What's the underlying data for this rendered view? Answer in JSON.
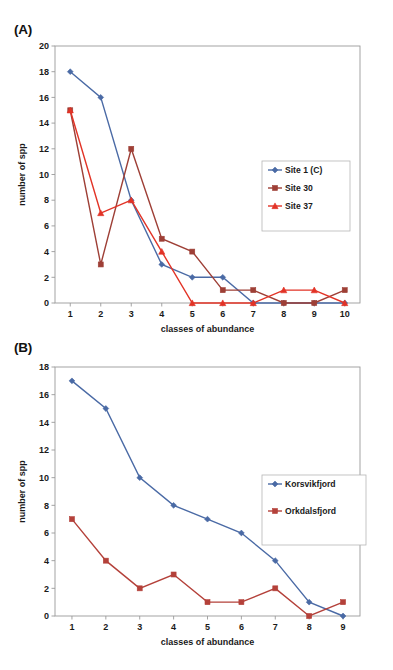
{
  "figure": {
    "panels": [
      {
        "id": "A",
        "label": "(A)",
        "xlabel": "classes of abundance",
        "ylabel": "number of spp"
      },
      {
        "id": "B",
        "label": "(B)",
        "xlabel": "classes of abundance",
        "ylabel": "number of spp"
      }
    ]
  },
  "chart_data": [
    {
      "type": "line",
      "panel": "A",
      "title": "(A)",
      "xlabel": "classes of abundance",
      "ylabel": "number of spp",
      "x": [
        1,
        2,
        3,
        4,
        5,
        6,
        7,
        8,
        9,
        10
      ],
      "xticklabels": [
        "1",
        "2",
        "3",
        "4",
        "5",
        "6",
        "7",
        "8",
        "9",
        "10"
      ],
      "yticklabels": [
        "0",
        "2",
        "4",
        "6",
        "8",
        "10",
        "12",
        "14",
        "16",
        "18",
        "20"
      ],
      "yticks": [
        0,
        2,
        4,
        6,
        8,
        10,
        12,
        14,
        16,
        18,
        20
      ],
      "xlim": [
        0.5,
        10.5
      ],
      "ylim": [
        0,
        20
      ],
      "grid": false,
      "legend_position": "right-middle",
      "series": [
        {
          "name": "Site 1 (C)",
          "values": [
            18,
            16,
            8,
            3,
            2,
            2,
            0,
            0,
            0,
            0
          ],
          "color": "#4a6aa5",
          "marker": "diamond"
        },
        {
          "name": "Site 30",
          "values": [
            15,
            3,
            12,
            5,
            4,
            1,
            1,
            0,
            0,
            1
          ],
          "color": "#9e3f36",
          "marker": "square"
        },
        {
          "name": "Site 37",
          "values": [
            15,
            7,
            8,
            4,
            0,
            0,
            0,
            1,
            1,
            0
          ],
          "color": "#e23326",
          "marker": "triangle"
        }
      ]
    },
    {
      "type": "line",
      "panel": "B",
      "title": "(B)",
      "xlabel": "classes of abundance",
      "ylabel": "number of spp",
      "x": [
        1,
        2,
        3,
        4,
        5,
        6,
        7,
        8,
        9
      ],
      "xticklabels": [
        "1",
        "2",
        "3",
        "4",
        "5",
        "6",
        "7",
        "8",
        "9"
      ],
      "yticklabels": [
        "0",
        "2",
        "4",
        "6",
        "8",
        "10",
        "12",
        "14",
        "16",
        "18"
      ],
      "yticks": [
        0,
        2,
        4,
        6,
        8,
        10,
        12,
        14,
        16,
        18
      ],
      "xlim": [
        0.5,
        9.5
      ],
      "ylim": [
        0,
        18
      ],
      "grid": false,
      "legend_position": "right-middle",
      "series": [
        {
          "name": "Korsvikfjord",
          "values": [
            17,
            15,
            10,
            8,
            7,
            6,
            4,
            1,
            0
          ],
          "color": "#4a6aa5",
          "marker": "diamond"
        },
        {
          "name": "Orkdalsfjord",
          "values": [
            7,
            4,
            2,
            3,
            1,
            1,
            2,
            0,
            1
          ],
          "color": "#b4413a",
          "marker": "square"
        }
      ]
    }
  ]
}
